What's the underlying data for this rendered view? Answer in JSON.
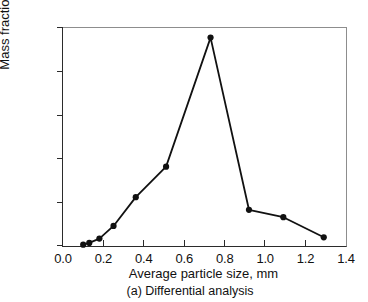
{
  "chart_data": {
    "type": "line",
    "title": "",
    "subtitle": "",
    "caption": "(a) Differential analysis",
    "xlabel": "Average particle size, mm",
    "ylabel": "Mass fraction",
    "xlim": [
      0.0,
      1.4
    ],
    "ylim": [
      0.0,
      0.5
    ],
    "xticks": [
      "0.0",
      "0.2",
      "0.4",
      "0.6",
      "0.8",
      "1.0",
      "1.2",
      "1.4"
    ],
    "xtick_values": [
      0.0,
      0.2,
      0.4,
      0.6,
      0.8,
      1.0,
      1.2,
      1.4
    ],
    "yticks": [
      "0.0",
      "0.1",
      "0.2",
      "0.3",
      "0.4",
      "0.5"
    ],
    "ytick_values": [
      0.0,
      0.1,
      0.2,
      0.3,
      0.4,
      0.5
    ],
    "grid": false,
    "legend": false,
    "legend_position": "none",
    "marker": "filled-circle",
    "line_color": "#111111",
    "marker_color": "#111111",
    "x": [
      0.1,
      0.13,
      0.18,
      0.25,
      0.36,
      0.51,
      0.73,
      0.92,
      1.09,
      1.29
    ],
    "y": [
      0.003,
      0.007,
      0.017,
      0.046,
      0.112,
      0.182,
      0.478,
      0.083,
      0.066,
      0.02
    ],
    "series": [
      {
        "name": "Mass fraction",
        "points": [
          {
            "x": 0.1,
            "y": 0.003
          },
          {
            "x": 0.13,
            "y": 0.007
          },
          {
            "x": 0.18,
            "y": 0.017
          },
          {
            "x": 0.25,
            "y": 0.046
          },
          {
            "x": 0.36,
            "y": 0.112
          },
          {
            "x": 0.51,
            "y": 0.182
          },
          {
            "x": 0.73,
            "y": 0.478
          },
          {
            "x": 0.92,
            "y": 0.083
          },
          {
            "x": 1.09,
            "y": 0.066
          },
          {
            "x": 1.29,
            "y": 0.02
          }
        ]
      }
    ]
  }
}
